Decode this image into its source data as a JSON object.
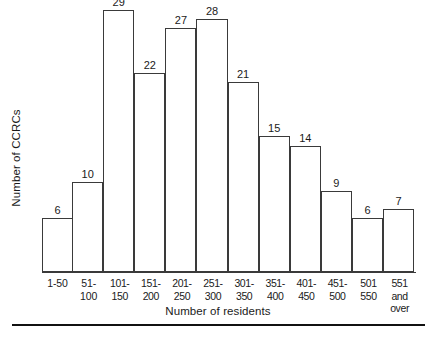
{
  "chart_data": {
    "type": "bar",
    "title": "",
    "subtitle": "",
    "xlabel": "Number of residents",
    "ylabel": "Number of CCRCs",
    "categories": [
      "1-50",
      "51-100",
      "101-\n150",
      "151-\n200",
      "201-\n250",
      "251-\n300",
      "301-\n350",
      "351-\n400",
      "401-\n450",
      "451-\n500",
      "501\n550",
      "551 and\nover"
    ],
    "values": [
      6,
      10,
      29,
      22,
      27,
      28,
      21,
      15,
      14,
      9,
      6,
      7
    ],
    "data_labels": [
      "6",
      "10",
      "29",
      "22",
      "27",
      "28",
      "21",
      "15",
      "14",
      "9",
      "6",
      "7"
    ],
    "ylim": [
      0,
      29
    ],
    "xlim_note": "categorical, 12 adjacent bins",
    "grid": false,
    "legend": null,
    "legend_position": "none",
    "bar_fill": "#ffffff",
    "bar_stroke": "#3a3a3a",
    "axis_color": "#3a3a3a",
    "text_color": "#1a1a1a",
    "background": "#ffffff",
    "y_axis_ticks_visible": false,
    "bars_adjacent": true,
    "annotations": []
  },
  "figure": {
    "bottom_rule_color": "#111111"
  }
}
